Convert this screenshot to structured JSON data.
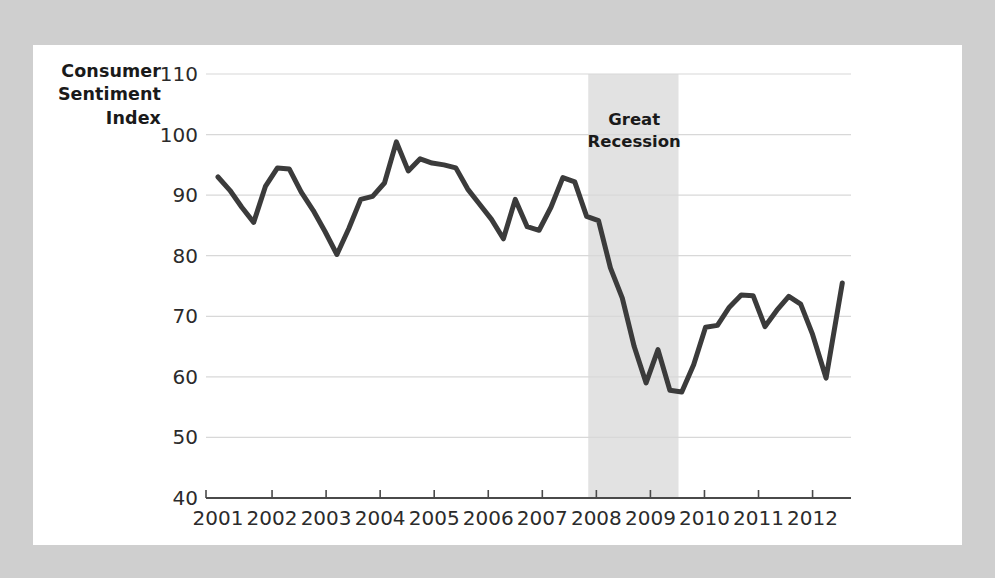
{
  "chart_data": {
    "type": "line",
    "title": "",
    "ylabel": "Consumer Sentiment Index",
    "ylabel_lines": [
      "Consumer",
      "Sentiment",
      "Index"
    ],
    "xlabel": "",
    "ylim": [
      40,
      110
    ],
    "yticks": [
      40,
      50,
      60,
      70,
      80,
      90,
      100,
      110
    ],
    "ytick_labels": [
      "40",
      "50",
      "60",
      "70",
      "80",
      "90",
      "100",
      "110"
    ],
    "xlim": [
      2001.0,
      2012.6
    ],
    "xticks": [
      2001,
      2002,
      2003,
      2004,
      2005,
      2006,
      2007,
      2008,
      2009,
      2010,
      2011,
      2012
    ],
    "xtick_labels": [
      "2001",
      "2002",
      "2003",
      "2004",
      "2005",
      "2006",
      "2007",
      "2008",
      "2009",
      "2010",
      "2011",
      "2012"
    ],
    "grid": true,
    "legend": "none",
    "line_color": "#3b3b3b",
    "grid_color": "#d8d8d8",
    "axis_color": "#4a4a4a",
    "band_color": "#e2e2e2",
    "series": [
      {
        "name": "Consumer Sentiment Index",
        "x": [
          2001.0,
          2001.22,
          2001.44,
          2001.66,
          2001.88,
          2002.1,
          2002.32,
          2002.54,
          2002.76,
          2002.98,
          2003.2,
          2003.42,
          2003.64,
          2003.86,
          2004.08,
          2004.3,
          2004.52,
          2004.74,
          2004.96,
          2005.18,
          2005.4,
          2005.62,
          2005.84,
          2006.06,
          2006.28,
          2006.5,
          2006.72,
          2006.94,
          2007.16,
          2007.38,
          2007.6,
          2007.82,
          2008.04,
          2008.26,
          2008.48,
          2008.7,
          2008.92,
          2009.14,
          2009.36,
          2009.58,
          2009.8,
          2010.02,
          2010.24,
          2010.46,
          2010.68,
          2010.9,
          2011.12,
          2011.34,
          2011.56,
          2011.78,
          2012.0,
          2012.25,
          2012.55
        ],
        "values": [
          93.0,
          90.8,
          88.0,
          85.5,
          91.5,
          94.5,
          94.3,
          90.5,
          87.5,
          84.0,
          80.2,
          84.5,
          89.3,
          89.8,
          92.0,
          98.8,
          94.0,
          96.0,
          95.3,
          95.0,
          94.5,
          91.0,
          88.5,
          86.0,
          82.8,
          89.3,
          84.8,
          84.2,
          88.0,
          92.9,
          92.2,
          86.5,
          85.8,
          78.0,
          73.0,
          65.0,
          59.0,
          64.5,
          57.8,
          57.5,
          62.0,
          68.2,
          68.5,
          71.5,
          73.5,
          73.4,
          68.3,
          71.0,
          73.3,
          72.0,
          67.0,
          59.8,
          75.5
        ]
      }
    ],
    "annotations": [
      {
        "name": "great-recession-band",
        "label_lines": [
          "Great",
          "Recession"
        ],
        "x_start": 2007.85,
        "x_end": 2009.52,
        "label_x": 2008.7,
        "label_y_top": 101.5
      }
    ]
  }
}
